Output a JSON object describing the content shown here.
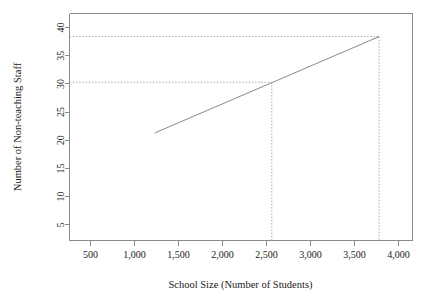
{
  "chart_data": {
    "type": "line",
    "title": "",
    "xlabel": "School Size (Number of Students)",
    "ylabel": "Number of Non-teaching Staff",
    "xlim": [
      260,
      4160
    ],
    "ylim": [
      2.2,
      42.5
    ],
    "grid": false,
    "legend": null,
    "xticks": [
      500,
      1000,
      1500,
      2000,
      2500,
      3000,
      3500,
      4000
    ],
    "xticklabels": [
      "500",
      "1,000",
      "1,500",
      "2,000",
      "2,500",
      "3,000",
      "3,500",
      "4,000"
    ],
    "yticks": [
      5,
      10,
      15,
      20,
      25,
      30,
      35,
      40
    ],
    "yticklabels": [
      "5",
      "10",
      "15",
      "20",
      "25",
      "30",
      "35",
      "40"
    ],
    "series": [
      {
        "name": "regression-line",
        "x": [
          1230,
          3780
        ],
        "values": [
          21.3,
          38.4
        ]
      }
    ],
    "annotations": [
      {
        "name": "reference-marker-lower",
        "x": 2560,
        "y": 30.3,
        "style": "dotted-crosshair"
      },
      {
        "name": "reference-marker-upper",
        "x": 3780,
        "y": 38.4,
        "style": "dotted-crosshair"
      }
    ]
  },
  "axes": {
    "x_title": "School Size (Number of Students)",
    "y_title": "Number of Non-teaching Staff"
  },
  "colors": {
    "axis": "#8a8a8a",
    "data_line": "#7a7a7a",
    "reference_line": "#9a9a9a",
    "text": "#1a1a1a",
    "background": "#ffffff"
  }
}
